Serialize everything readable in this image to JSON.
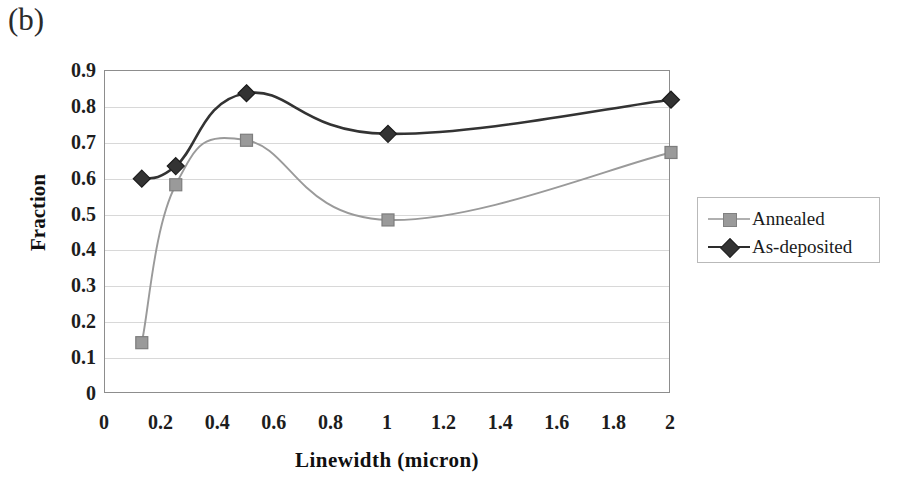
{
  "panel_label": "(b)",
  "chart_data": {
    "type": "line",
    "title": "",
    "xlabel": "Linewidth (micron)",
    "ylabel": "Fraction",
    "xlim": [
      0,
      2
    ],
    "ylim": [
      0,
      0.9
    ],
    "xticks": [
      "0",
      "0.2",
      "0.4",
      "0.6",
      "0.8",
      "1",
      "1.2",
      "1.4",
      "1.6",
      "1.8",
      "2"
    ],
    "xtick_values": [
      0,
      0.2,
      0.4,
      0.6,
      0.8,
      1,
      1.2,
      1.4,
      1.6,
      1.8,
      2
    ],
    "yticks": [
      "0",
      "0.1",
      "0.2",
      "0.3",
      "0.4",
      "0.5",
      "0.6",
      "0.7",
      "0.8",
      "0.9"
    ],
    "ytick_values": [
      0,
      0.1,
      0.2,
      0.3,
      0.4,
      0.5,
      0.6,
      0.7,
      0.8,
      0.9
    ],
    "grid": true,
    "legend_position": "right",
    "x": [
      0.13,
      0.25,
      0.5,
      1.0,
      2.0
    ],
    "series": [
      {
        "name": "Annealed",
        "marker": "square",
        "color": "#9a9a9a",
        "values": [
          0.143,
          0.583,
          0.707,
          0.485,
          0.673
        ]
      },
      {
        "name": "As-deposited",
        "marker": "diamond",
        "color": "#333333",
        "values": [
          0.6,
          0.635,
          0.838,
          0.725,
          0.82
        ]
      }
    ]
  },
  "legend": {
    "items": [
      {
        "label": "Annealed",
        "marker": "square-marker",
        "color": "#9a9a9a"
      },
      {
        "label": "As-deposited",
        "marker": "diamond-marker",
        "color": "#333333"
      }
    ]
  }
}
